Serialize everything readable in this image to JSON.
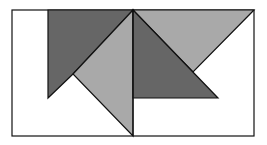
{
  "diagram": {
    "width": 267,
    "height": 145,
    "colors": {
      "background": "#ffffff",
      "dark": "#666666",
      "light": "#a9a9a9",
      "stroke": "#111111"
    },
    "frame": {
      "x": 12,
      "y": 10,
      "w": 242,
      "h": 126
    },
    "divider": {
      "x1": 133,
      "y1": 10,
      "x2": 133,
      "y2": 136
    },
    "shapes": [
      {
        "name": "dark-left-polygon",
        "fill": "dark",
        "points": "48,10 133,10 73,74 48,98"
      },
      {
        "name": "light-center-triangle",
        "fill": "light",
        "points": "133,10 133,136 73,74"
      },
      {
        "name": "light-top-right-triangle",
        "fill": "light",
        "points": "133,10 254,10 193,72"
      },
      {
        "name": "dark-right-triangle",
        "fill": "dark",
        "points": "133,10 218,98 133,98"
      }
    ]
  }
}
